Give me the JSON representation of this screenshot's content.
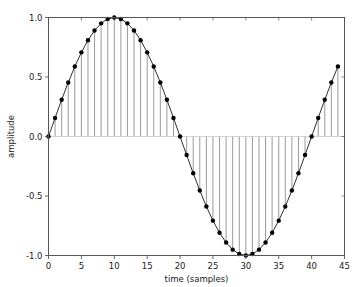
{
  "chart_data": {
    "type": "line",
    "title": "",
    "subtitle": "",
    "xlabel": "time (samples)",
    "ylabel": "amplitude",
    "xlim": [
      0,
      45
    ],
    "ylim": [
      -1.0,
      1.0
    ],
    "grid": false,
    "legend": null,
    "style": {
      "marker": "circle",
      "marker_color": "#000000",
      "line_color": "#1a1a1a",
      "stem_color": "#808080",
      "baseline_color": "#c8c8c8",
      "axes_color": "#555555",
      "background": "#ffffff"
    },
    "xticks": [
      0,
      5,
      10,
      15,
      20,
      25,
      30,
      35,
      40,
      45
    ],
    "xticklabels": [
      "0",
      "5",
      "10",
      "15",
      "20",
      "25",
      "30",
      "35",
      "40",
      "45"
    ],
    "yticks": [
      -1.0,
      -0.5,
      0.0,
      0.5,
      1.0
    ],
    "yticklabels": [
      "-1.0",
      "-0.5",
      "0.0",
      "0.5",
      "1.0"
    ],
    "x": [
      0,
      1,
      2,
      3,
      4,
      5,
      6,
      7,
      8,
      9,
      10,
      11,
      12,
      13,
      14,
      15,
      16,
      17,
      18,
      19,
      20,
      21,
      22,
      23,
      24,
      25,
      26,
      27,
      28,
      29,
      30,
      31,
      32,
      33,
      34,
      35,
      36,
      37,
      38,
      39,
      40,
      41,
      42,
      43,
      44
    ],
    "values": [
      0.0,
      0.156,
      0.309,
      0.454,
      0.588,
      0.707,
      0.809,
      0.891,
      0.951,
      0.988,
      1.0,
      0.988,
      0.951,
      0.891,
      0.809,
      0.707,
      0.588,
      0.454,
      0.309,
      0.156,
      0.0,
      -0.156,
      -0.309,
      -0.454,
      -0.588,
      -0.707,
      -0.809,
      -0.891,
      -0.951,
      -0.988,
      -1.0,
      -0.988,
      -0.951,
      -0.891,
      -0.809,
      -0.707,
      -0.588,
      -0.454,
      -0.309,
      -0.156,
      0.0,
      0.156,
      0.309,
      0.454,
      0.588
    ]
  }
}
